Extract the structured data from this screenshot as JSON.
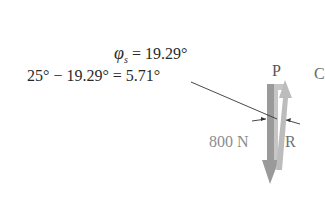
{
  "equations": {
    "line1": {
      "symbol": "φ",
      "subscript": "s",
      "rest": " = 19.29°"
    },
    "line2": "25° − 19.29° = 5.71°"
  },
  "labels": {
    "p": "P",
    "force": "800 N",
    "r": "R",
    "partial_c": "C"
  },
  "vectors": [
    {
      "name": "800 N",
      "direction": "down",
      "color": "#9a9a9a"
    },
    {
      "name": "P",
      "direction": "up",
      "color": "#b8b8b8"
    },
    {
      "name": "R",
      "direction": "resultant",
      "color": "#c0c0c0"
    }
  ],
  "angle_annotation": "5.71°"
}
